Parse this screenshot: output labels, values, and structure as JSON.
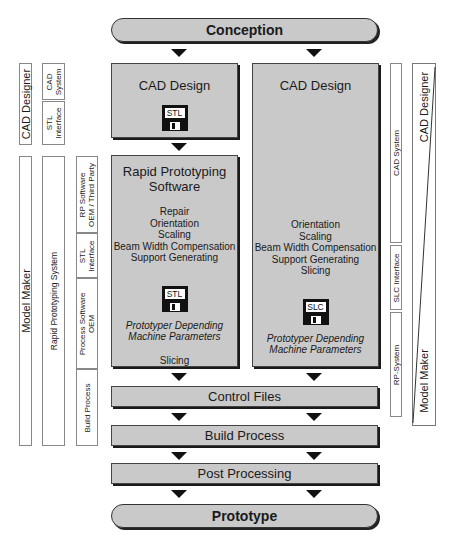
{
  "flow": {
    "conception": "Conception",
    "prototype": "Prototype",
    "control_files": "Control Files",
    "build_process": "Build Process",
    "post_processing": "Post Processing"
  },
  "left_column": {
    "cad_design_title": "CAD Design",
    "cad_file_label": "STL",
    "rp_software_title": "Rapid Prototyping Software",
    "rp_operations": [
      "Repair",
      "Orientation",
      "Scaling",
      "Beam Width Compensation",
      "Support Generating"
    ],
    "rp_file_label": "STL",
    "machine_params_line1": "Prototyper Depending",
    "machine_params_line2": "Machine Parameters",
    "final_step": "Slicing"
  },
  "right_column": {
    "cad_design_title": "CAD Design",
    "operations": [
      "Orientation",
      "Scaling",
      "Beam Width Compensation",
      "Support Generating",
      "Slicing"
    ],
    "file_label": "SLC",
    "machine_params_line1": "Prototyper Depending",
    "machine_params_line2": "Machine Parameters"
  },
  "left_labels": {
    "cad_designer": "CAD Designer",
    "cad_system_line1": "CAD",
    "cad_system_line2": "System",
    "stl_interface_line1": "STL",
    "stl_interface_line2": "Interface",
    "model_maker": "Model Maker",
    "rapid_prototyping_system": "Rapid Prototyping System",
    "rp_software_line1": "RP Software",
    "rp_software_line2": "OEM / Third Party",
    "stl_interface2_line1": "STL",
    "stl_interface2_line2": "Interface",
    "process_software_line1": "Process Software",
    "process_software_line2": "OEM",
    "build_process": "Build Process"
  },
  "right_labels": {
    "cad_system": "CAD System",
    "slc_interface": "SLC Interface",
    "rp_system": "RP-System",
    "cad_designer": "CAD Designer",
    "model_maker": "Model Maker"
  }
}
